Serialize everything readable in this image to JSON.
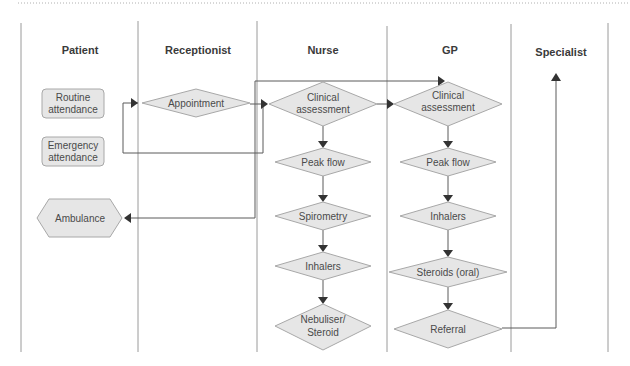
{
  "diagram": {
    "type": "swimlane-flowchart",
    "lanes": [
      {
        "id": "patient",
        "label": "Patient"
      },
      {
        "id": "receptionist",
        "label": "Receptionist"
      },
      {
        "id": "nurse",
        "label": "Nurse"
      },
      {
        "id": "gp",
        "label": "GP"
      },
      {
        "id": "specialist",
        "label": "Specialist"
      }
    ],
    "nodes": {
      "routine": {
        "lines": [
          "Routine",
          "attendance"
        ],
        "shape": "rounded-rect",
        "lane": "patient"
      },
      "emergency": {
        "lines": [
          "Emergency",
          "attendance"
        ],
        "shape": "rounded-rect",
        "lane": "patient"
      },
      "ambulance": {
        "lines": [
          "Ambulance"
        ],
        "shape": "hexagon",
        "lane": "patient"
      },
      "appointment": {
        "lines": [
          "Appointment"
        ],
        "shape": "diamond",
        "lane": "receptionist"
      },
      "nurse_clinical": {
        "lines": [
          "Clinical",
          "assessment"
        ],
        "shape": "diamond",
        "lane": "nurse"
      },
      "nurse_peak": {
        "lines": [
          "Peak flow"
        ],
        "shape": "diamond",
        "lane": "nurse"
      },
      "nurse_spiro": {
        "lines": [
          "Spirometry"
        ],
        "shape": "diamond",
        "lane": "nurse"
      },
      "nurse_inhalers": {
        "lines": [
          "Inhalers"
        ],
        "shape": "diamond",
        "lane": "nurse"
      },
      "nurse_nebuliser": {
        "lines": [
          "Nebuliser/",
          "Steroid"
        ],
        "shape": "diamond",
        "lane": "nurse"
      },
      "gp_clinical": {
        "lines": [
          "Clinical",
          "assessment"
        ],
        "shape": "diamond",
        "lane": "gp"
      },
      "gp_peak": {
        "lines": [
          "Peak flow"
        ],
        "shape": "diamond",
        "lane": "gp"
      },
      "gp_inhalers": {
        "lines": [
          "Inhalers"
        ],
        "shape": "diamond",
        "lane": "gp"
      },
      "gp_steroids": {
        "lines": [
          "Steroids (oral)"
        ],
        "shape": "diamond",
        "lane": "gp"
      },
      "gp_referral": {
        "lines": [
          "Referral"
        ],
        "shape": "diamond",
        "lane": "gp"
      }
    },
    "edges": [
      {
        "from": "routine/emergency",
        "to": "appointment"
      },
      {
        "from": "appointment",
        "to": "nurse_clinical"
      },
      {
        "from": "emergency",
        "to": "nurse_clinical"
      },
      {
        "from": "nurse_clinical",
        "to": "gp_clinical"
      },
      {
        "from": "emergency",
        "to": "gp_clinical"
      },
      {
        "from": "nurse",
        "to": "ambulance"
      },
      {
        "from": "nurse_clinical",
        "to": "nurse_peak"
      },
      {
        "from": "nurse_peak",
        "to": "nurse_spiro"
      },
      {
        "from": "nurse_spiro",
        "to": "nurse_inhalers"
      },
      {
        "from": "nurse_inhalers",
        "to": "nurse_nebuliser"
      },
      {
        "from": "gp_clinical",
        "to": "gp_peak"
      },
      {
        "from": "gp_peak",
        "to": "gp_inhalers"
      },
      {
        "from": "gp_inhalers",
        "to": "gp_steroids"
      },
      {
        "from": "gp_steroids",
        "to": "gp_referral"
      },
      {
        "from": "gp_referral",
        "to": "specialist"
      }
    ],
    "colors": {
      "shape_fill": "#e6e6e6",
      "shape_stroke": "#a8a8a8",
      "lane_line": "#9a9a9a",
      "connector": "#5a5a5a",
      "text": "#4a4a4a"
    }
  }
}
